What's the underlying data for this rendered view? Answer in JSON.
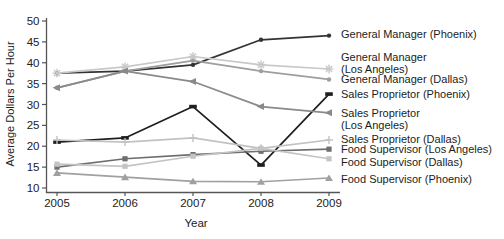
{
  "figure": {
    "ylabel": "Average Dollars Per Hour",
    "xlabel": "Year"
  },
  "chart_data": {
    "type": "line",
    "title": "",
    "xlabel": "Year",
    "ylabel": "Average Dollars Per Hour",
    "x": [
      2005,
      2006,
      2007,
      2008,
      2009
    ],
    "x_tick_labels": [
      "2005",
      "2006",
      "2007",
      "2008",
      "2009"
    ],
    "ylim": [
      10,
      50
    ],
    "yticks": [
      10,
      15,
      20,
      25,
      30,
      35,
      40,
      45,
      50
    ],
    "grid": false,
    "legend_position": "right-annotations",
    "series": [
      {
        "name": "General Manager (Phoenix)",
        "label_lines": [
          "General Manager (Phoenix)"
        ],
        "color": "#333333",
        "marker": "dot",
        "values": [
          37.5,
          38.0,
          39.5,
          45.5,
          46.5
        ]
      },
      {
        "name": "General Manager (Los Angeles)",
        "label_lines": [
          "General Manager",
          "(Los Angeles)"
        ],
        "color": "#c8c8c8",
        "marker": "asterisk",
        "values": [
          37.5,
          39.0,
          41.5,
          39.5,
          38.5
        ]
      },
      {
        "name": "General Manager (Dallas)",
        "label_lines": [
          "General Manager (Dallas)"
        ],
        "color": "#9e9e9e",
        "marker": "dot",
        "values": [
          34.0,
          38.0,
          40.5,
          38.0,
          36.0
        ]
      },
      {
        "name": "Sales Proprietor (Phoenix)",
        "label_lines": [
          "Sales Proprietor (Phoenix)"
        ],
        "color": "#1f1f1f",
        "marker": "dash",
        "values": [
          21.0,
          22.0,
          29.5,
          15.5,
          32.5
        ]
      },
      {
        "name": "Sales Proprietor (Los Angeles)",
        "label_lines": [
          "Sales Proprietor",
          "(Los Angeles)"
        ],
        "color": "#8a8a8a",
        "marker": "tri-left",
        "values": [
          34.0,
          38.0,
          35.5,
          29.5,
          28.0
        ]
      },
      {
        "name": "Sales Proprietor (Dallas)",
        "label_lines": [
          "Sales Proprietor (Dallas)"
        ],
        "color": "#c2c2c2",
        "marker": "plus",
        "values": [
          21.5,
          21.0,
          22.0,
          19.5,
          21.5
        ]
      },
      {
        "name": "Food Supervisor (Los Angeles)",
        "label_lines": [
          "Food Supervisor (Los Angeles)"
        ],
        "color": "#6e6e6e",
        "marker": "square",
        "values": [
          15.0,
          17.0,
          18.0,
          18.8,
          19.3
        ]
      },
      {
        "name": "Food Supervisor (Dallas)",
        "label_lines": [
          "Food Supervisor (Dallas)"
        ],
        "color": "#c4c4c4",
        "marker": "square",
        "values": [
          15.7,
          15.2,
          17.6,
          19.5,
          17.0
        ]
      },
      {
        "name": "Food Supervisor (Phoenix)",
        "label_lines": [
          "Food Supervisor (Phoenix)"
        ],
        "color": "#a0a0a0",
        "marker": "triangle",
        "values": [
          13.6,
          12.6,
          11.6,
          11.5,
          12.4
        ]
      }
    ],
    "axis_color": "#555555",
    "text_color": "#222222"
  }
}
